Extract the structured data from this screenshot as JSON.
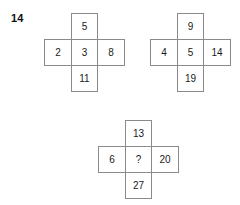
{
  "question": {
    "number": "14"
  },
  "style": {
    "border_color": "#8a8a8a",
    "text_color": "#1a1a1a",
    "background": "#ffffff"
  },
  "figures": [
    {
      "name": "cross-1",
      "top": "5",
      "left": "2",
      "center": "3",
      "right": "8",
      "bottom": "11"
    },
    {
      "name": "cross-2",
      "top": "9",
      "left": "4",
      "center": "5",
      "right": "14",
      "bottom": "19"
    },
    {
      "name": "cross-3",
      "top": "13",
      "left": "6",
      "center": "?",
      "right": "20",
      "bottom": "27"
    }
  ]
}
